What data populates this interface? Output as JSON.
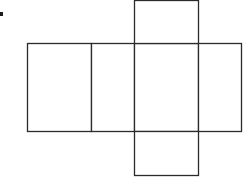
{
  "diagram": {
    "type": "box-net",
    "stroke_color": "#2b2b2b",
    "background_color": "#ffffff",
    "marker": {
      "x": 0,
      "y": 12,
      "w": 3,
      "h": 4
    },
    "faces": [
      {
        "id": "left-face",
        "x": 27,
        "y": 43,
        "w": 64,
        "h": 88
      },
      {
        "id": "side-face-1",
        "x": 91,
        "y": 43,
        "w": 43,
        "h": 88
      },
      {
        "id": "center-face",
        "x": 134,
        "y": 43,
        "w": 64,
        "h": 88
      },
      {
        "id": "side-face-2",
        "x": 198,
        "y": 43,
        "w": 43,
        "h": 88
      },
      {
        "id": "top-flap",
        "x": 134,
        "y": 0,
        "w": 64,
        "h": 43
      },
      {
        "id": "bottom-flap",
        "x": 134,
        "y": 131,
        "w": 64,
        "h": 44
      }
    ]
  }
}
